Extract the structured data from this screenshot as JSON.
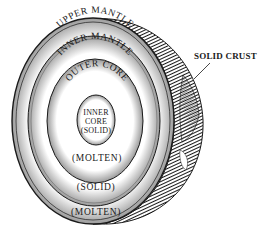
{
  "diagram": {
    "layers": [
      {
        "name": "upper-mantle",
        "label": "UPPER MANTLE",
        "state_label": "(MOLTEN)"
      },
      {
        "name": "inner-mantle",
        "label": "INNER MANTLE",
        "state_label": "(SOLID)"
      },
      {
        "name": "outer-core",
        "label": "OUTER CORE",
        "state_label": "(MOLTEN)"
      },
      {
        "name": "inner-core",
        "label_line1": "INNER",
        "label_line2": "CORE",
        "label_line3": "(SOLID)"
      }
    ],
    "callout": {
      "label": "SOLID CRUST"
    },
    "colors": {
      "ink": "#1a1a1a",
      "background": "#ffffff"
    }
  }
}
